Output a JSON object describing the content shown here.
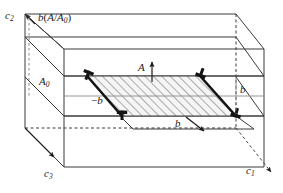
{
  "figure": {
    "type": "crystallographic-slip-diagram",
    "background_color": "#ffffff",
    "line_color": "#3a3a3a",
    "dark_line_color": "#141414",
    "hatch_color": "#6e6e6e",
    "hatch_fill": "#f2f2f2"
  },
  "axes": [
    {
      "id": "c1",
      "base": "c",
      "sub": "1",
      "label": "c1",
      "position": "bottom-right",
      "arrow": "down-right",
      "line_style": "dashed"
    },
    {
      "id": "c2",
      "base": "c",
      "sub": "2",
      "label": "c2",
      "position": "top-left",
      "arrow": "up-left",
      "line_style": "solid"
    },
    {
      "id": "c3",
      "base": "c",
      "sub": "3",
      "label": "c3",
      "position": "bottom-left",
      "arrow": "down-right",
      "line_style": "solid"
    }
  ],
  "labels": {
    "burgers_shift": {
      "text": "b(A/A0)",
      "base": "b",
      "paren_open": "(",
      "numerator": "A",
      "slash": "/",
      "denominator": "A",
      "denominator_sub": "0",
      "paren_close": ")",
      "position": "top-left"
    },
    "reference_area": {
      "base": "A",
      "sub": "0",
      "text": "A0",
      "position": "left-slab"
    },
    "slipped_area": {
      "text": "A",
      "position": "center-top",
      "arrow": "up"
    },
    "burgers_negative": {
      "text": "-b",
      "minus": "−",
      "base": "b",
      "position": "left-edge-of-loop"
    },
    "burgers_right": {
      "text": "b",
      "base": "b",
      "position": "right-edge"
    },
    "burgers_bottom": {
      "text": "b",
      "base": "b",
      "position": "bottom-center",
      "arrow": "down-right"
    }
  },
  "dislocation_symbols": [
    {
      "id": "disl-top-left",
      "glyph": "inverted-tee",
      "rotation_deg": 20,
      "corner": "top-left"
    },
    {
      "id": "disl-top-right",
      "glyph": "inverted-tee",
      "rotation_deg": 180,
      "corner": "top-right"
    },
    {
      "id": "disl-bottom-left",
      "glyph": "inverted-tee",
      "rotation_deg": 0,
      "corner": "bottom-left"
    },
    {
      "id": "disl-bottom-right",
      "glyph": "inverted-tee",
      "rotation_deg": 180,
      "corner": "bottom-right"
    }
  ],
  "regions": {
    "slipped_area_fill": "hatched-45-degrees",
    "slab": "horizontal-middle-slab"
  }
}
